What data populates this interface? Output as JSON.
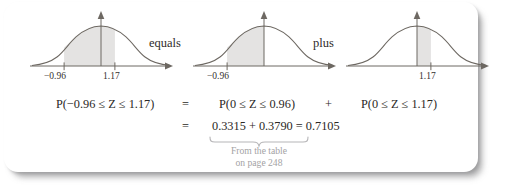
{
  "figure": {
    "kind": "normal-distribution-decomposition",
    "connectors": {
      "equals_label": "equals",
      "plus_label": "plus"
    },
    "curves": [
      {
        "id": "curve-combined",
        "shade_from": -0.96,
        "shade_to": 1.17,
        "ticks": [
          {
            "value": -0.96,
            "label": "−0.96"
          },
          {
            "value": 1.17,
            "label": "1.17"
          }
        ],
        "center_line": true
      },
      {
        "id": "curve-left",
        "shade_from": -0.96,
        "shade_to": 0,
        "ticks": [
          {
            "value": -0.96,
            "label": "−0.96"
          }
        ],
        "center_line": true
      },
      {
        "id": "curve-right",
        "shade_from": 0,
        "shade_to": 1.17,
        "ticks": [
          {
            "value": 1.17,
            "label": "1.17"
          }
        ],
        "center_line": true
      }
    ],
    "equation": {
      "row1": {
        "left": "P(−0.96 ≤ Z ≤ 1.17)",
        "eq1": "=",
        "middle": "P(0 ≤ Z ≤ 0.96)",
        "op": "+",
        "right": "P(0 ≤ Z ≤ 1.17)"
      },
      "row2": {
        "eq2": "=",
        "expression": "0.3315 + 0.3790 = 0.7105"
      }
    },
    "caption": {
      "line1": "From the table",
      "line2": "on page 248"
    },
    "colors": {
      "shade": "#e4e3e2",
      "stroke": "#6d6862",
      "text": "#2b2825",
      "caption": "#a3a2a4",
      "card": "#ffffff"
    }
  }
}
